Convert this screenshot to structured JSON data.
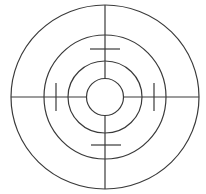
{
  "diagram": {
    "type": "concentric-target-reticle",
    "width": 206,
    "height": 194,
    "background": "#ffffff",
    "stroke_color": "#3a3a3a",
    "center": {
      "x": 105,
      "y": 97
    },
    "rings": [
      {
        "name": "outer-ring",
        "rx": 94,
        "ry": 92
      },
      {
        "name": "second-ring",
        "rx": 61,
        "ry": 62
      },
      {
        "name": "third-ring",
        "rx": 37,
        "ry": 36
      },
      {
        "name": "inner-ring",
        "rx": 18.5,
        "ry": 18.5
      }
    ],
    "crosshair_segments": [
      {
        "name": "crosshair-top",
        "x1": 105,
        "y1": 5,
        "x2": 105,
        "y2": 78.5
      },
      {
        "name": "crosshair-bottom",
        "x1": 105,
        "y1": 115.5,
        "x2": 105,
        "y2": 189
      },
      {
        "name": "crosshair-left",
        "x1": 11,
        "y1": 97,
        "x2": 86.5,
        "y2": 97
      },
      {
        "name": "crosshair-right",
        "x1": 123.5,
        "y1": 97,
        "x2": 199,
        "y2": 97
      }
    ],
    "ticks": [
      {
        "name": "tick-top",
        "x1": 90,
        "y1": 49,
        "x2": 120,
        "y2": 49
      },
      {
        "name": "tick-bottom",
        "x1": 91,
        "y1": 145,
        "x2": 121,
        "y2": 145
      },
      {
        "name": "tick-left",
        "x1": 56,
        "y1": 83,
        "x2": 56,
        "y2": 111
      },
      {
        "name": "tick-right",
        "x1": 154,
        "y1": 83,
        "x2": 154,
        "y2": 111
      }
    ]
  }
}
